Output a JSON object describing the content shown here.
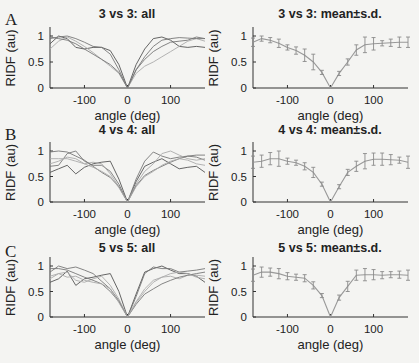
{
  "figure": {
    "panels": [
      {
        "letter": "A",
        "left_title": "3 vs 3: all",
        "right_title": "3 vs 3: mean±s.d."
      },
      {
        "letter": "B",
        "left_title": "4 vs 4: all",
        "right_title": "4 vs 4: mean±s.d."
      },
      {
        "letter": "C",
        "left_title": "5 vs 5: all",
        "right_title": "5 vs 5: mean±s.d."
      }
    ],
    "xlabel": "angle (deg)",
    "ylabel": "RIDF (au)",
    "xticks": [
      "-100",
      "0",
      "100"
    ],
    "yticks": [
      "0",
      "0.5",
      "1"
    ],
    "colors": {
      "trace_dark": "#555555",
      "trace_mid": "#777777",
      "trace_light": "#aaaaaa",
      "mean": "#999999",
      "axis": "#333333"
    }
  },
  "chart_data": [
    {
      "type": "line",
      "title": "3 vs 3: all",
      "xlabel": "angle (deg)",
      "ylabel": "RIDF (au)",
      "xlim": [
        -180,
        180
      ],
      "ylim": [
        0,
        1.15
      ],
      "grid": false,
      "x": [
        -180,
        -160,
        -140,
        -120,
        -100,
        -80,
        -60,
        -40,
        -20,
        0,
        20,
        40,
        60,
        80,
        100,
        120,
        140,
        160,
        180
      ],
      "series": [
        {
          "name": "trace 1",
          "values": [
            0.85,
            1.0,
            0.95,
            0.78,
            0.75,
            0.78,
            0.78,
            0.72,
            0.45,
            0,
            0.45,
            0.75,
            0.95,
            0.98,
            0.92,
            0.8,
            0.78,
            0.8,
            0.78
          ]
        },
        {
          "name": "trace 2",
          "values": [
            0.95,
            0.98,
            1.0,
            0.95,
            0.88,
            0.8,
            0.78,
            0.65,
            0.35,
            0,
            0.35,
            0.55,
            0.7,
            0.8,
            0.88,
            0.9,
            0.92,
            0.98,
            0.95
          ]
        },
        {
          "name": "trace 3",
          "values": [
            0.75,
            0.9,
            0.98,
            0.9,
            0.8,
            0.68,
            0.55,
            0.42,
            0.28,
            0,
            0.28,
            0.42,
            0.5,
            0.6,
            0.7,
            0.8,
            0.9,
            0.95,
            0.9
          ]
        },
        {
          "name": "trace 4",
          "values": [
            0.98,
            0.95,
            0.92,
            0.85,
            0.75,
            0.65,
            0.55,
            0.45,
            0.3,
            0,
            0.35,
            0.6,
            0.8,
            0.92,
            0.95,
            0.97,
            0.96,
            0.95,
            0.95
          ]
        }
      ]
    },
    {
      "type": "line",
      "title": "3 vs 3: mean±s.d.",
      "xlabel": "angle (deg)",
      "ylabel": "RIDF (au)",
      "xlim": [
        -180,
        180
      ],
      "ylim": [
        0,
        1.15
      ],
      "grid": false,
      "x": [
        -180,
        -160,
        -140,
        -120,
        -100,
        -80,
        -60,
        -40,
        -20,
        0,
        20,
        40,
        60,
        80,
        100,
        120,
        140,
        160,
        180
      ],
      "series": [
        {
          "name": "mean",
          "values": [
            0.88,
            0.95,
            0.92,
            0.86,
            0.78,
            0.72,
            0.63,
            0.5,
            0.3,
            0,
            0.28,
            0.5,
            0.73,
            0.83,
            0.85,
            0.86,
            0.87,
            0.88,
            0.88
          ]
        },
        {
          "name": "sd",
          "values": [
            0.08,
            0.05,
            0.05,
            0.08,
            0.05,
            0.07,
            0.12,
            0.15,
            0.04,
            0,
            0.04,
            0.06,
            0.1,
            0.15,
            0.12,
            0.05,
            0.07,
            0.1,
            0.1
          ]
        }
      ]
    },
    {
      "type": "line",
      "title": "4 vs 4: all",
      "xlabel": "angle (deg)",
      "ylabel": "RIDF (au)",
      "xlim": [
        -180,
        180
      ],
      "ylim": [
        0,
        1.15
      ],
      "grid": false,
      "x": [
        -180,
        -160,
        -140,
        -120,
        -100,
        -80,
        -60,
        -40,
        -20,
        0,
        20,
        40,
        60,
        80,
        100,
        120,
        140,
        160,
        180
      ],
      "series": [
        {
          "name": "trace 1",
          "values": [
            0.58,
            0.65,
            0.72,
            0.55,
            0.68,
            0.75,
            0.78,
            0.8,
            0.45,
            0,
            0.4,
            0.7,
            0.78,
            0.85,
            0.75,
            0.65,
            0.68,
            0.7,
            0.58
          ]
        },
        {
          "name": "trace 2",
          "values": [
            0.7,
            0.72,
            0.95,
            1.0,
            0.8,
            0.72,
            0.72,
            0.6,
            0.35,
            0,
            0.45,
            0.8,
            0.98,
            0.9,
            0.85,
            0.88,
            0.9,
            0.88,
            0.82
          ]
        },
        {
          "name": "trace 3",
          "values": [
            0.85,
            0.85,
            0.85,
            0.8,
            0.75,
            0.78,
            0.75,
            0.55,
            0.3,
            0,
            0.35,
            0.6,
            0.75,
            0.95,
            1.0,
            0.92,
            0.85,
            0.82,
            0.85
          ]
        },
        {
          "name": "trace 4",
          "values": [
            0.98,
            1.0,
            0.98,
            0.9,
            0.82,
            0.7,
            0.58,
            0.48,
            0.3,
            0,
            0.32,
            0.52,
            0.62,
            0.7,
            0.78,
            0.85,
            0.9,
            0.92,
            0.92
          ]
        },
        {
          "name": "trace 5",
          "values": [
            0.75,
            0.8,
            0.88,
            0.85,
            0.75,
            0.68,
            0.6,
            0.5,
            0.28,
            0,
            0.3,
            0.5,
            0.6,
            0.72,
            0.8,
            0.85,
            0.82,
            0.75,
            0.72
          ]
        }
      ]
    },
    {
      "type": "line",
      "title": "4 vs 4: mean±s.d.",
      "xlabel": "angle (deg)",
      "ylabel": "RIDF (au)",
      "xlim": [
        -180,
        180
      ],
      "ylim": [
        0,
        1.15
      ],
      "grid": false,
      "x": [
        -180,
        -160,
        -140,
        -120,
        -100,
        -80,
        -60,
        -40,
        -20,
        0,
        20,
        40,
        60,
        80,
        100,
        120,
        140,
        160,
        180
      ],
      "series": [
        {
          "name": "mean",
          "values": [
            0.78,
            0.8,
            0.85,
            0.85,
            0.8,
            0.77,
            0.7,
            0.58,
            0.35,
            0,
            0.3,
            0.58,
            0.7,
            0.8,
            0.84,
            0.84,
            0.83,
            0.82,
            0.78
          ]
        },
        {
          "name": "sd",
          "values": [
            0.12,
            0.12,
            0.12,
            0.15,
            0.06,
            0.05,
            0.07,
            0.1,
            0.04,
            0,
            0.04,
            0.06,
            0.1,
            0.15,
            0.12,
            0.12,
            0.1,
            0.06,
            0.12
          ]
        }
      ]
    },
    {
      "type": "line",
      "title": "5 vs 5: all",
      "xlabel": "angle (deg)",
      "ylabel": "RIDF (au)",
      "xlim": [
        -180,
        180
      ],
      "ylim": [
        0,
        1.15
      ],
      "grid": false,
      "x": [
        -180,
        -160,
        -140,
        -120,
        -100,
        -80,
        -60,
        -40,
        -20,
        0,
        20,
        40,
        60,
        80,
        100,
        120,
        140,
        160,
        180
      ],
      "series": [
        {
          "name": "trace 1",
          "values": [
            0.68,
            0.75,
            0.9,
            0.62,
            0.75,
            0.78,
            0.82,
            0.85,
            0.5,
            0,
            0.45,
            0.88,
            0.95,
            1.0,
            0.92,
            0.85,
            0.85,
            0.8,
            0.68
          ]
        },
        {
          "name": "trace 2",
          "values": [
            0.88,
            1.0,
            0.95,
            0.98,
            0.92,
            0.85,
            0.7,
            0.55,
            0.32,
            0,
            0.4,
            0.85,
            0.98,
            0.95,
            0.95,
            0.88,
            0.9,
            0.92,
            0.95
          ]
        },
        {
          "name": "trace 3",
          "values": [
            0.75,
            0.85,
            0.88,
            0.72,
            0.68,
            0.75,
            0.8,
            0.62,
            0.35,
            0,
            0.3,
            0.55,
            0.72,
            0.78,
            0.8,
            0.75,
            0.82,
            0.82,
            0.8
          ]
        },
        {
          "name": "trace 4",
          "values": [
            0.95,
            0.95,
            0.92,
            0.85,
            0.78,
            0.72,
            0.65,
            0.5,
            0.3,
            0,
            0.25,
            0.45,
            0.55,
            0.65,
            0.72,
            0.78,
            0.82,
            0.85,
            0.88
          ]
        },
        {
          "name": "trace 5",
          "values": [
            0.8,
            0.85,
            0.78,
            0.8,
            0.72,
            0.68,
            0.65,
            0.55,
            0.28,
            0,
            0.28,
            0.5,
            0.68,
            0.78,
            0.85,
            0.88,
            0.85,
            0.78,
            0.75
          ]
        }
      ]
    },
    {
      "type": "line",
      "title": "5 vs 5: mean±s.d.",
      "xlabel": "angle (deg)",
      "ylabel": "RIDF (au)",
      "xlim": [
        -180,
        180
      ],
      "ylim": [
        0,
        1.15
      ],
      "grid": false,
      "x": [
        -180,
        -160,
        -140,
        -120,
        -100,
        -80,
        -60,
        -40,
        -20,
        0,
        20,
        40,
        60,
        80,
        100,
        120,
        140,
        160,
        180
      ],
      "series": [
        {
          "name": "mean",
          "values": [
            0.82,
            0.88,
            0.88,
            0.85,
            0.8,
            0.78,
            0.76,
            0.62,
            0.42,
            0,
            0.38,
            0.6,
            0.82,
            0.83,
            0.83,
            0.82,
            0.83,
            0.83,
            0.82
          ]
        },
        {
          "name": "sd",
          "values": [
            0.12,
            0.1,
            0.08,
            0.1,
            0.07,
            0.06,
            0.07,
            0.07,
            0.04,
            0,
            0.05,
            0.1,
            0.1,
            0.12,
            0.1,
            0.07,
            0.06,
            0.07,
            0.1
          ]
        }
      ]
    }
  ]
}
